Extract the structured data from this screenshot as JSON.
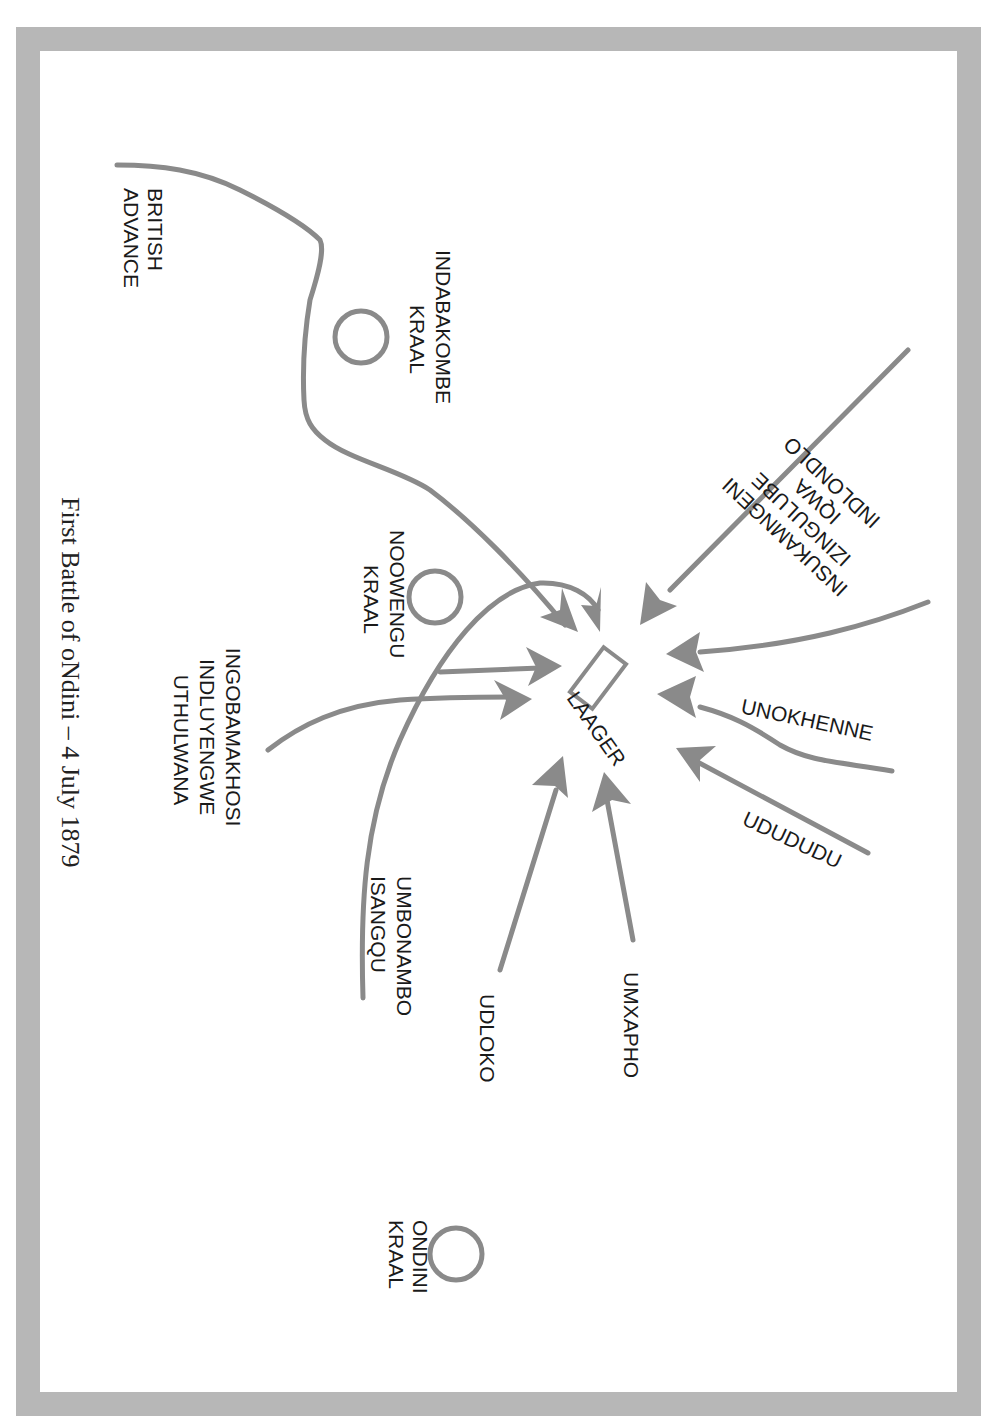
{
  "title": "First Battle of oNdini – 4 July 1879",
  "colors": {
    "frame": "#b7b7b7",
    "route": "#8a8a8a",
    "text": "#1a1a1a",
    "background": "#ffffff"
  },
  "labels": {
    "british_advance": [
      "BRITISH",
      "ADVANCE"
    ],
    "indabakombe_kraal": [
      "INDABAKOMBE",
      "KRAAL"
    ],
    "noowengu_kraal": [
      "NOOWENGU",
      "KRAAL"
    ],
    "ondini_kraal": [
      "ONDINI",
      "KRAAL"
    ],
    "laager": "LAAGER",
    "northern_regiments": [
      "INSUKAMNGENI",
      "IZINGULUBE",
      "IQWA",
      "INDLONDLO"
    ],
    "unokhenne": "UNOKHENNE",
    "ududu": "UDUDUDU",
    "umxapho": "UMXAPHO",
    "udloko": "UDLOKO",
    "umbonambo": [
      "UMBONAMBO",
      "ISANGQU"
    ],
    "ingobamakhosi": [
      "INGOBAMAKHOSI",
      "INDLUYENGWE",
      "UTHULWANA"
    ]
  }
}
